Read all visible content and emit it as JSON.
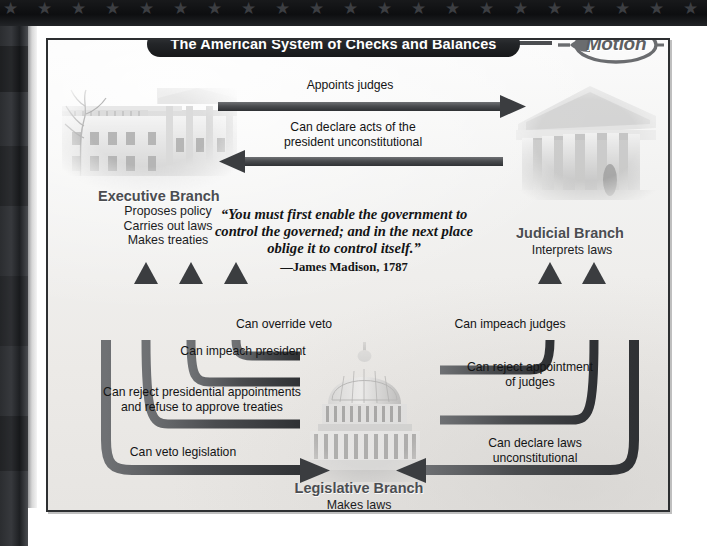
{
  "title": "The American System of Checks and Balances",
  "badge": {
    "line1": "In",
    "line2": "Motion",
    "icon": "left-arrow-oval-icon"
  },
  "branches": {
    "executive": {
      "title": "Executive Branch",
      "duties": "Proposes policy\nCarries out laws\nMakes treaties",
      "image": "white-house-photo"
    },
    "judicial": {
      "title": "Judicial Branch",
      "duties": "Interprets laws",
      "image": "supreme-court-photo"
    },
    "legislative": {
      "title": "Legislative Branch",
      "duties": "Makes laws",
      "image": "us-capitol-photo"
    }
  },
  "quote": {
    "text": "“You must first enable the government to control the governed; and in the next place oblige it to control itself.”",
    "attribution": "—James Madison, 1787"
  },
  "arrows": {
    "appoints_judges": "Appoints judges",
    "declare_acts_unconstitutional": "Can declare acts of the\npresident unconstitutional",
    "override_veto": "Can override veto",
    "impeach_president": "Can impeach president",
    "reject_appointments": "Can reject presidential appointments\nand refuse to approve treaties",
    "veto_legislation": "Can veto legislation",
    "impeach_judges": "Can impeach judges",
    "reject_appointment_judges": "Can reject appointment\nof judges",
    "declare_laws_unconstitutional": "Can declare laws\nunconstitutional"
  },
  "colors": {
    "title_pill": "#232528",
    "arrow": "#4e5053",
    "frame_border": "#2d2f31",
    "paper": "#f1efec",
    "branch_label": "#4b4d51",
    "badge_text": "#5d5f62"
  }
}
